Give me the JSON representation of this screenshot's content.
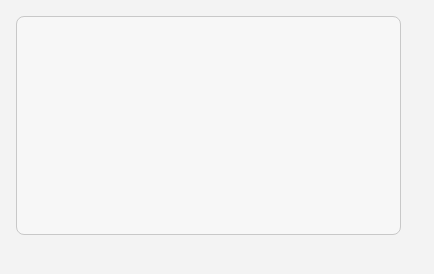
{
  "diagram": {
    "nodes": {
      "demolition_waste": "Demolition waste",
      "storing": "Storing",
      "separating": "Separating",
      "digging": "Digging",
      "disposal": "Disposal",
      "wastes": "Wastes",
      "primary_crushing": "Primary Crushing",
      "final_product": "Final Product",
      "scrap_iron": "Scrap Iron",
      "magnetic_separator": "Magnetic Separator",
      "water_supply": "Water Supply",
      "washing_screening": "Washing & Screening",
      "manual_removal": "Manual Removal",
      "secondary_crushing": "Secondary Crushing"
    },
    "edges": [
      [
        "Demolition waste",
        "Storing"
      ],
      [
        "Storing",
        "Separating"
      ],
      [
        "Separating",
        "Digging"
      ],
      [
        "Separating",
        "Wastes"
      ],
      [
        "Digging",
        "Primary Crushing"
      ],
      [
        "Digging",
        "Wastes"
      ],
      [
        "Wastes",
        "Disposal"
      ],
      [
        "Primary Crushing",
        "Magnetic Separator"
      ],
      [
        "Magnetic Separator",
        "Scrap Iron"
      ],
      [
        "Magnetic Separator",
        "Secondary Crushing"
      ],
      [
        "Secondary Crushing",
        "Manual Removal"
      ],
      [
        "Manual Removal",
        "Washing & Screening"
      ],
      [
        "Manual Removal",
        "Wastes"
      ],
      [
        "Water Supply",
        "Washing & Screening"
      ],
      [
        "Washing & Screening",
        "Final Product"
      ]
    ]
  }
}
